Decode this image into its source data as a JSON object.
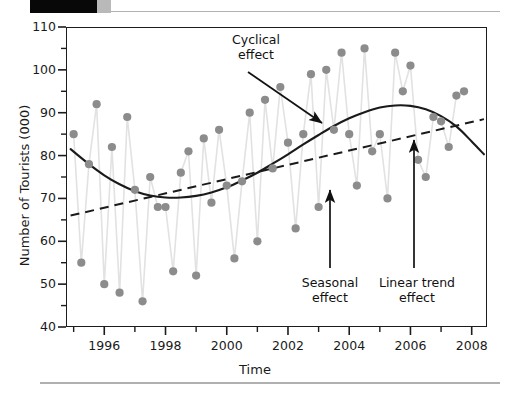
{
  "figure": {
    "xlabel": "Time",
    "ylabel": "Number of Tourists (000)"
  },
  "annotations": {
    "cyclical": "Cyclical\neffect",
    "seasonal": "Seasonal\neffect",
    "linear": "Linear trend\neffect"
  },
  "axes": {
    "y_ticks": [
      "110",
      "100",
      "90",
      "80",
      "70",
      "60",
      "50",
      "40"
    ],
    "x_ticks": [
      "1996",
      "1998",
      "2000",
      "2002",
      "2004",
      "2006",
      "2008"
    ]
  },
  "chart_data": {
    "type": "line",
    "title": "",
    "xlabel": "Time",
    "ylabel": "Number of Tourists (000)",
    "xlim": [
      1994.75,
      2008.5
    ],
    "ylim": [
      40,
      110
    ],
    "y_ticks_major": [
      40,
      50,
      60,
      70,
      80,
      90,
      100,
      110
    ],
    "y_ticks_minor": [
      45,
      55,
      65,
      75,
      85,
      95,
      105
    ],
    "x_ticks_major": [
      1996,
      1998,
      2000,
      2002,
      2004,
      2006,
      2008
    ],
    "x_ticks_minor": [
      1995,
      1997,
      1999,
      2001,
      2003,
      2005,
      2007
    ],
    "grid": false,
    "legend": null,
    "marker_color": "#8c8c8c",
    "connector_color": "#e2e2e2",
    "trend_color": "#1a1a1a",
    "series": [
      {
        "name": "Observed quarterly tourists",
        "style": "markers-with-light-connector",
        "x": [
          1995.0,
          1995.25,
          1995.5,
          1995.75,
          1996.0,
          1996.25,
          1996.5,
          1996.75,
          1997.0,
          1997.25,
          1997.5,
          1997.75,
          1998.0,
          1998.25,
          1998.5,
          1998.75,
          1999.0,
          1999.25,
          1999.5,
          1999.75,
          2000.0,
          2000.25,
          2000.5,
          2000.75,
          2001.0,
          2001.25,
          2001.5,
          2001.75,
          2002.0,
          2002.25,
          2002.5,
          2002.75,
          2003.0,
          2003.25,
          2003.5,
          2003.75,
          2004.0,
          2004.25,
          2004.5,
          2004.75,
          2005.0,
          2005.25,
          2005.5,
          2005.75,
          2006.0,
          2006.25,
          2006.5,
          2006.75,
          2007.0,
          2007.25,
          2007.5,
          2007.75
        ],
        "y": [
          85,
          55,
          78,
          92,
          50,
          82,
          48,
          89,
          72,
          46,
          75,
          68,
          68,
          53,
          76,
          81,
          52,
          84,
          69,
          86,
          73,
          56,
          74,
          90,
          60,
          93,
          77,
          96,
          83,
          63,
          85,
          99,
          68,
          100,
          86,
          104,
          85,
          73,
          105,
          81,
          85,
          70,
          104,
          95,
          101,
          79,
          75,
          89,
          88,
          82,
          94,
          95
        ]
      },
      {
        "name": "Cyclical effect (smooth curve)",
        "style": "solid",
        "x": [
          1994.9,
          1995.5,
          1996.0,
          1996.5,
          1997.0,
          1997.5,
          1998.0,
          1998.5,
          1999.0,
          1999.5,
          2000.0,
          2000.5,
          2001.0,
          2001.5,
          2002.0,
          2002.5,
          2003.0,
          2003.5,
          2004.0,
          2004.5,
          2005.0,
          2005.5,
          2006.0,
          2006.5,
          2007.0,
          2007.5,
          2008.0,
          2008.4
        ],
        "y": [
          81.5,
          78.0,
          75.4,
          73.3,
          71.7,
          70.7,
          70.2,
          70.2,
          70.6,
          71.4,
          72.6,
          74.2,
          76.0,
          78.1,
          80.3,
          82.6,
          84.8,
          86.9,
          88.7,
          90.1,
          91.2,
          91.7,
          91.6,
          90.8,
          89.2,
          86.8,
          83.3,
          80.3
        ]
      },
      {
        "name": "Linear trend effect",
        "style": "dashed",
        "x": [
          1994.9,
          2008.4
        ],
        "y": [
          66.0,
          88.5
        ]
      }
    ],
    "annotations": [
      {
        "text": "Cyclical effect",
        "points_to_series": "Cyclical effect (smooth curve)",
        "at_x": 2003.3,
        "at_y": 85.5
      },
      {
        "text": "Seasonal effect",
        "points_to_series": "Observed quarterly tourists",
        "at_x": 2003.0,
        "at_y": 68.0
      },
      {
        "text": "Linear trend effect",
        "points_to_series": "Linear trend effect",
        "at_x": 2005.05,
        "at_y": 85.0
      }
    ]
  }
}
